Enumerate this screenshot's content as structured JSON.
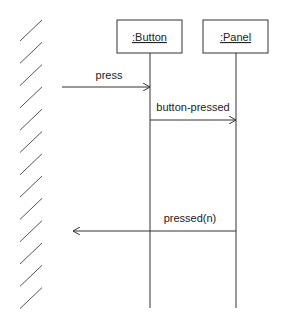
{
  "diagram": {
    "type": "sequence",
    "actor": {
      "name": "external-boundary",
      "style": "hatched"
    },
    "objects": [
      {
        "id": "button",
        "label": ":Button"
      },
      {
        "id": "panel",
        "label": ":Panel"
      }
    ],
    "messages": [
      {
        "label": "press",
        "from": "external",
        "to": "button"
      },
      {
        "label": "button-pressed",
        "from": "button",
        "to": "panel"
      },
      {
        "label": "pressed(n)",
        "from": "panel",
        "to": "external"
      }
    ],
    "colors": {
      "line": "#333333",
      "hatch": "#555555",
      "background": "#ffffff"
    }
  }
}
